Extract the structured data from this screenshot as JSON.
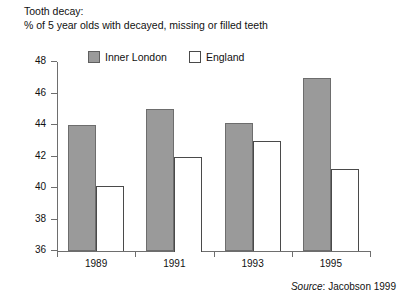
{
  "title": {
    "line1": "Tooth decay:",
    "line2": "% of 5 year olds with decayed, missing or filled teeth"
  },
  "legend": {
    "items": [
      {
        "label": "Inner London",
        "color": "#9a9a9a",
        "style": "filled"
      },
      {
        "label": "England",
        "color": "#ffffff",
        "style": "outlined"
      }
    ]
  },
  "source": {
    "label": "Source",
    "separator": ": ",
    "text": "Jacobson 1999"
  },
  "chart_data": {
    "type": "bar",
    "title": "Tooth decay: % of 5 year olds with decayed, missing or filled teeth",
    "subtitle": "% of 5 year olds with decayed, missing or filled teeth",
    "xlabel": "",
    "ylabel": "",
    "categories": [
      "1989",
      "1991",
      "1993",
      "1995"
    ],
    "series": [
      {
        "name": "Inner London",
        "color": "#9a9a9a",
        "values": [
          44.0,
          45.0,
          44.1,
          47.0
        ]
      },
      {
        "name": "England",
        "color": "#ffffff",
        "values": [
          40.1,
          42.0,
          43.0,
          41.2
        ]
      }
    ],
    "ylim": [
      36,
      48
    ],
    "yticks": [
      36,
      38,
      40,
      42,
      44,
      46,
      48
    ],
    "ytick_labels": [
      "36",
      "38",
      "40",
      "42",
      "44",
      "46",
      "48"
    ],
    "grid": false,
    "legend_position": "top-left-inside",
    "source": "Source: Jacobson 1999"
  }
}
